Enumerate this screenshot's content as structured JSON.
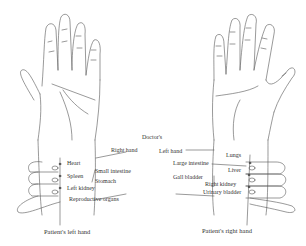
{
  "diagram": {
    "center_label": "Doctor's",
    "left_panel": {
      "caption": "Patient's left hand",
      "doctor_hand": "Right hand",
      "labels": [
        "Heart",
        "Small intestine",
        "Spleen",
        "Stomach",
        "Left kidney",
        "Reproductive organs"
      ]
    },
    "right_panel": {
      "caption": "Patient's right hand",
      "doctor_hand": "Left hand",
      "labels": [
        "Lungs",
        "Large intestine",
        "Liver",
        "Gall bladder",
        "Right kidney",
        "Urinary bladder"
      ]
    },
    "colors": {
      "line": "#555555",
      "text": "#333333",
      "background": "#ffffff"
    }
  }
}
